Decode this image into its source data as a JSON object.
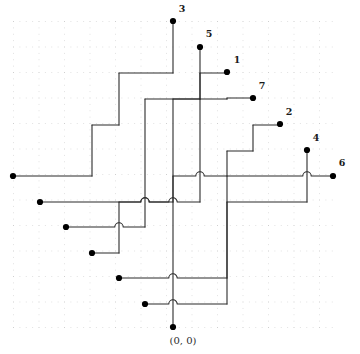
{
  "figure": {
    "type": "orthogonal-wiring-diagram",
    "title": "",
    "origin_label": "(0, 0)",
    "grid": {
      "x_min": 13,
      "x_max": 333,
      "y_min": 21,
      "y_max": 327,
      "cell": 25.5,
      "cols": 12,
      "rows": 12,
      "style": "dotted",
      "color": "#cfcfcf",
      "minor_dot_color": "#e2e2e2"
    },
    "colors": {
      "wire": "#2b2b2b",
      "terminal": "#000000",
      "background": "#ffffff",
      "label": "#1a1a1a"
    },
    "terminals": [
      {
        "id": "3",
        "label": "3",
        "x": 173,
        "y": 21,
        "label_x": 182,
        "label_y": 12
      },
      {
        "id": "5",
        "label": "5",
        "x": 200,
        "y": 47,
        "label_x": 209,
        "label_y": 37
      },
      {
        "id": "1",
        "label": "1",
        "x": 227,
        "y": 72,
        "label_x": 237,
        "label_y": 63
      },
      {
        "id": "7",
        "label": "7",
        "x": 253,
        "y": 98,
        "label_x": 262,
        "label_y": 89
      },
      {
        "id": "2",
        "label": "2",
        "x": 280,
        "y": 124,
        "label_x": 289,
        "label_y": 115
      },
      {
        "id": "4",
        "label": "4",
        "x": 307,
        "y": 150,
        "label_x": 316,
        "label_y": 141
      },
      {
        "id": "6",
        "label": "6",
        "x": 333,
        "y": 176,
        "label_x": 342,
        "label_y": 166
      }
    ],
    "source_terminals": [
      {
        "id": "s1",
        "x": 13,
        "y": 176
      },
      {
        "id": "s2",
        "x": 40,
        "y": 202
      },
      {
        "id": "s3",
        "x": 66,
        "y": 227
      },
      {
        "id": "s4",
        "x": 92,
        "y": 253
      },
      {
        "id": "s5",
        "x": 119,
        "y": 278
      },
      {
        "id": "s6",
        "x": 145,
        "y": 304
      },
      {
        "id": "s7",
        "x": 173,
        "y": 327
      }
    ],
    "origin_terminal": {
      "x": 173,
      "y": 327
    },
    "wires": [
      {
        "id": "w3",
        "to": "3",
        "points": [
          [
            13,
            176
          ],
          [
            92,
            176
          ],
          [
            92,
            125
          ],
          [
            119,
            125
          ],
          [
            119,
            73
          ],
          [
            173,
            73
          ],
          [
            173,
            21
          ]
        ]
      },
      {
        "id": "w5",
        "to": "5",
        "points": [
          [
            40,
            202
          ],
          [
            173,
            202
          ],
          [
            173,
            99
          ],
          [
            200,
            99
          ],
          [
            200,
            47
          ]
        ]
      },
      {
        "id": "w1",
        "to": "1",
        "points": [
          [
            66,
            227
          ],
          [
            145,
            227
          ],
          [
            145,
            99
          ],
          [
            200,
            99
          ],
          [
            200,
            73
          ],
          [
            227,
            73
          ]
        ]
      },
      {
        "id": "w7",
        "to": "7",
        "points": [
          [
            92,
            253
          ],
          [
            119,
            253
          ],
          [
            119,
            202
          ],
          [
            200,
            202
          ],
          [
            200,
            99
          ],
          [
            227,
            99
          ],
          [
            227,
            98
          ],
          [
            253,
            98
          ]
        ]
      },
      {
        "id": "w2",
        "to": "2",
        "points": [
          [
            119,
            278
          ],
          [
            227,
            278
          ],
          [
            227,
            151
          ],
          [
            253,
            151
          ],
          [
            253,
            125
          ],
          [
            280,
            125
          ]
        ]
      },
      {
        "id": "w4",
        "to": "4",
        "points": [
          [
            145,
            304
          ],
          [
            227,
            304
          ],
          [
            227,
            202
          ],
          [
            307,
            202
          ],
          [
            307,
            150
          ]
        ]
      },
      {
        "id": "w6",
        "to": "6",
        "points": [
          [
            173,
            327
          ],
          [
            173,
            176
          ],
          [
            227,
            176
          ],
          [
            227,
            176
          ],
          [
            333,
            176
          ]
        ]
      }
    ],
    "hop_count": 22
  }
}
